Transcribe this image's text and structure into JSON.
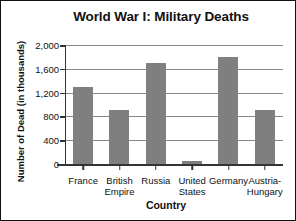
{
  "chart_data": {
    "type": "bar",
    "title": "World War I: Military Deaths",
    "xlabel": "Country",
    "ylabel": "Number of Dead (in thousands)",
    "categories": [
      "France",
      "British Empire",
      "Russia",
      "United States",
      "Germany",
      "Austria-Hungary"
    ],
    "category_lines": [
      [
        "France"
      ],
      [
        "British",
        "Empire"
      ],
      [
        "Russia"
      ],
      [
        "United",
        "States"
      ],
      [
        "Germany"
      ],
      [
        "Austria-",
        "Hungary"
      ]
    ],
    "values": [
      1300,
      900,
      1700,
      50,
      1800,
      900
    ],
    "ylim": [
      0,
      2000
    ],
    "yticks": [
      0,
      400,
      800,
      1200,
      1600,
      2000
    ],
    "ytick_labels": [
      "0",
      "400",
      "800",
      "1,200",
      "1,600",
      "2,000"
    ],
    "grid": true,
    "legend": "none",
    "bar_color": "#7f7f7f",
    "axis_color": "#333333",
    "grid_color": "#8a8a8a",
    "background": "#ffffff",
    "border_color": "#111111"
  }
}
